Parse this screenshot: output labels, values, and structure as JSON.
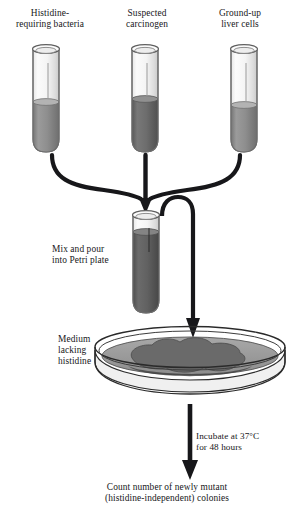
{
  "diagram": {
    "type": "scientific-process-flow",
    "background_color": "#ffffff",
    "ink_color": "#17171a"
  },
  "tubes": [
    {
      "id": "tube-histidine-bacteria",
      "label": "Histidine-\nrequiring bacteria",
      "contents_color": "#8a8a8a",
      "glass_color": "#f2f2f2"
    },
    {
      "id": "tube-suspected-carcinogen",
      "label": "Suspected\ncarcinogen",
      "contents_color": "#6e6e6e",
      "glass_color": "#f2f2f2"
    },
    {
      "id": "tube-liver-cells",
      "label": "Ground-up\nliver cells",
      "contents_color": "#8a8a8a",
      "glass_color": "#f2f2f2"
    }
  ],
  "mix_tube": {
    "id": "tube-mixture",
    "label": "Mix and pour\ninto Petri plate",
    "contents_color": "#5e5e5e",
    "glass_color": "#f2f2f2"
  },
  "petri_plate": {
    "id": "petri-plate",
    "label": "Medium\nlacking\nhistidine",
    "medium_color": "#9e9e9e",
    "colony_color": "#656565",
    "rim_color": "#2a2a2a"
  },
  "incubation": {
    "label": "Incubate at 37°C\nfor 48 hours"
  },
  "result": {
    "label": "Count number of newly mutant\n(histidine-independent) colonies"
  },
  "arrows": {
    "merge_left": "curved-arrow-left-to-center",
    "merge_center": "straight-arrow-down-to-center",
    "merge_right": "curved-arrow-right-to-center",
    "pour": "curved-arrow-tube-to-plate",
    "incubate": "straight-arrow-plate-to-result"
  }
}
